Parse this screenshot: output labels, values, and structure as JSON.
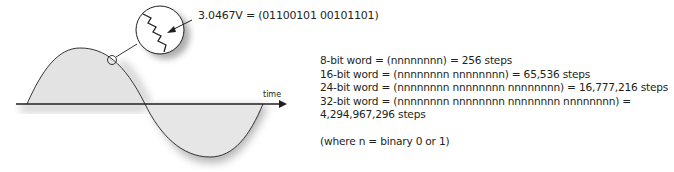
{
  "diagram": {
    "axis_label": "time",
    "callout": "3.0467V = (01100101 00101101)",
    "colors": {
      "wave_fill": "#e3e3e3",
      "stroke": "#231f20",
      "shadow": "#9a9a9a"
    },
    "icons": {
      "magnifier": "magnifier-circle-icon",
      "staircase": "quantization-staircase-icon",
      "arrow": "arrow-icon"
    }
  },
  "info": {
    "lines": [
      "8-bit word = (nnnnnnnn) = 256 steps",
      "16-bit word = (nnnnnnnn nnnnnnnn) = 65,536 steps",
      "24-bit word = (nnnnnnnn nnnnnnnn nnnnnnnn) = 16,777,216 steps",
      "32-bit word = (nnnnnnnn nnnnnnnn nnnnnnnn nnnnnnnn) =",
      "4,294,967,296 steps"
    ],
    "note": "(where n = binary 0 or 1)"
  }
}
